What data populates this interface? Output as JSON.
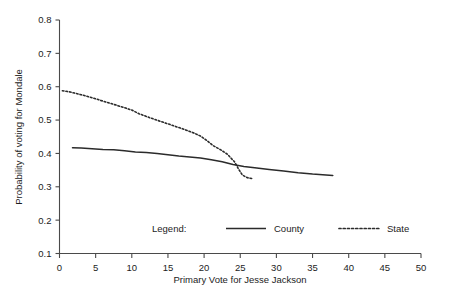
{
  "chart_data": {
    "type": "line",
    "title": "",
    "xlabel": "Primary Vote for Jesse Jackson",
    "ylabel": "Probability of voting for Mondale",
    "xlim": [
      0,
      50
    ],
    "ylim": [
      0.1,
      0.8
    ],
    "xticks": [
      "0",
      "5",
      "10",
      "15",
      "20",
      "25",
      "30",
      "35",
      "40",
      "45",
      "50"
    ],
    "yticks": [
      "0.1",
      "0.2",
      "0.3",
      "0.4",
      "0.5",
      "0.6",
      "0.7",
      "0.8"
    ],
    "grid": false,
    "legend_position": "inside-bottom",
    "legend_label": "Legend:",
    "series": [
      {
        "name": "County",
        "style": "solid",
        "color": "#2b2b2b",
        "points": [
          [
            1.8,
            0.417
          ],
          [
            3.0,
            0.416
          ],
          [
            4.5,
            0.414
          ],
          [
            6.0,
            0.412
          ],
          [
            7.5,
            0.411
          ],
          [
            9.0,
            0.408
          ],
          [
            10.5,
            0.404
          ],
          [
            12.0,
            0.403
          ],
          [
            13.5,
            0.4
          ],
          [
            15.0,
            0.396
          ],
          [
            16.5,
            0.392
          ],
          [
            18.0,
            0.389
          ],
          [
            19.5,
            0.386
          ],
          [
            21.0,
            0.381
          ],
          [
            22.5,
            0.375
          ],
          [
            24.0,
            0.367
          ],
          [
            25.5,
            0.361
          ],
          [
            27.0,
            0.357
          ],
          [
            29.0,
            0.352
          ],
          [
            31.0,
            0.347
          ],
          [
            33.0,
            0.342
          ],
          [
            35.0,
            0.338
          ],
          [
            37.8,
            0.334
          ]
        ]
      },
      {
        "name": "State",
        "style": "dotted",
        "color": "#2b2b2b",
        "points": [
          [
            0.4,
            0.588
          ],
          [
            1.5,
            0.584
          ],
          [
            3.0,
            0.576
          ],
          [
            4.5,
            0.567
          ],
          [
            6.0,
            0.557
          ],
          [
            7.5,
            0.547
          ],
          [
            9.0,
            0.537
          ],
          [
            10.0,
            0.53
          ],
          [
            11.0,
            0.519
          ],
          [
            12.5,
            0.507
          ],
          [
            14.0,
            0.496
          ],
          [
            15.5,
            0.485
          ],
          [
            17.0,
            0.474
          ],
          [
            18.5,
            0.462
          ],
          [
            19.5,
            0.452
          ],
          [
            20.3,
            0.44
          ],
          [
            21.2,
            0.424
          ],
          [
            22.2,
            0.412
          ],
          [
            23.2,
            0.398
          ],
          [
            24.2,
            0.375
          ],
          [
            24.8,
            0.352
          ],
          [
            25.3,
            0.335
          ],
          [
            26.0,
            0.327
          ],
          [
            26.6,
            0.325
          ]
        ]
      }
    ]
  },
  "legend": {
    "title": "Legend:",
    "items": [
      {
        "label": "County",
        "style": "solid"
      },
      {
        "label": "State",
        "style": "dotted"
      }
    ]
  }
}
